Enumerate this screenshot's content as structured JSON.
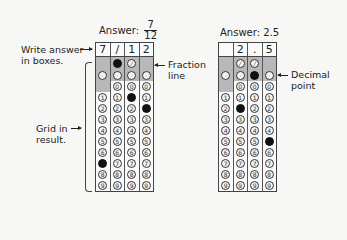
{
  "example1": {
    "title_prefix": "Answer:",
    "numerator": "7",
    "denominator": "12",
    "answer_boxes": [
      "7",
      "/",
      "1",
      "2"
    ],
    "slash_row": [
      false,
      true,
      true,
      false
    ],
    "slash_filled": [
      false,
      true,
      false,
      false
    ],
    "dot_filled": [
      false,
      false,
      false,
      false
    ],
    "digits_present": [
      [
        false,
        true,
        true,
        true,
        true,
        true,
        true,
        true,
        true,
        true
      ],
      [
        true,
        true,
        true,
        true,
        true,
        true,
        true,
        true,
        true,
        true
      ],
      [
        true,
        true,
        true,
        true,
        true,
        true,
        true,
        true,
        true,
        true
      ],
      [
        true,
        true,
        true,
        true,
        true,
        true,
        true,
        true,
        true,
        true
      ]
    ],
    "filled_digit": [
      7,
      null,
      1,
      2
    ]
  },
  "example2": {
    "title": "Answer: 2.5",
    "answer_boxes": [
      "",
      "2",
      ".",
      "5"
    ],
    "slash_row": [
      false,
      true,
      true,
      false
    ],
    "slash_filled": [
      false,
      false,
      false,
      false
    ],
    "dot_filled": [
      false,
      false,
      true,
      false
    ],
    "digits_present": [
      [
        false,
        true,
        true,
        true,
        true,
        true,
        true,
        true,
        true,
        true
      ],
      [
        true,
        true,
        true,
        true,
        true,
        true,
        true,
        true,
        true,
        true
      ],
      [
        true,
        true,
        true,
        true,
        true,
        true,
        true,
        true,
        true,
        true
      ],
      [
        true,
        true,
        true,
        true,
        true,
        true,
        true,
        true,
        true,
        true
      ]
    ],
    "filled_digit": [
      null,
      2,
      null,
      5
    ]
  },
  "annotations": {
    "write_answer_line1": "Write answer",
    "write_answer_line2": "in boxes.",
    "grid_in_line1": "Grid in",
    "grid_in_line2": "result.",
    "fraction_line1": "Fraction",
    "fraction_line2": "line",
    "decimal_line1": "Decimal",
    "decimal_line2": "point"
  },
  "digits": [
    "0",
    "1",
    "2",
    "3",
    "4",
    "5",
    "6",
    "7",
    "8",
    "9"
  ],
  "colors": {
    "filled": "#111111",
    "shade": "#b8b8b8",
    "ink": "#222222"
  }
}
